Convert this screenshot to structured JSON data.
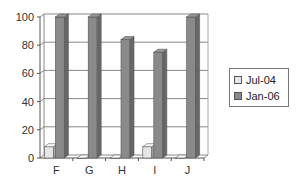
{
  "chart_data": {
    "type": "bar",
    "title": "",
    "xlabel": "",
    "ylabel": "",
    "categories": [
      "F",
      "G",
      "H",
      "I",
      "J"
    ],
    "series": [
      {
        "name": "Jul-04",
        "values": [
          8,
          0,
          0,
          8,
          0
        ],
        "color": "#e6e6e6"
      },
      {
        "name": "Jan-06",
        "values": [
          100,
          100,
          84,
          75,
          100
        ],
        "color": "#8a8a8a"
      }
    ],
    "ylim": [
      0,
      100
    ],
    "yticks": [
      0,
      20,
      40,
      60,
      80,
      100
    ],
    "grid": true,
    "legend_position": "right",
    "style": "3d-column"
  },
  "legend": {
    "items": [
      {
        "label": "Jul-04",
        "color": "#e6e6e6"
      },
      {
        "label": "Jan-06",
        "color": "#8a8a8a"
      }
    ]
  }
}
